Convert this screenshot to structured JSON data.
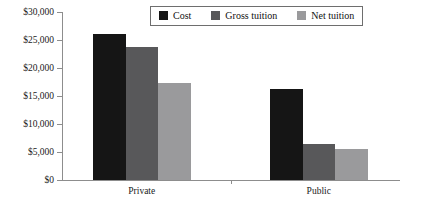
{
  "chart_data": {
    "type": "bar",
    "title": "",
    "xlabel": "",
    "ylabel": "",
    "categories": [
      "Private",
      "Public"
    ],
    "series": [
      {
        "name": "Cost",
        "color": "#151515",
        "values": [
          26000,
          16200
        ]
      },
      {
        "name": "Gross tuition",
        "color": "#58585a",
        "values": [
          23800,
          6400
        ]
      },
      {
        "name": "Net tuition",
        "color": "#9a9a9c",
        "values": [
          17300,
          5500
        ]
      }
    ],
    "ylim": [
      0,
      30000
    ],
    "yticks": [
      0,
      5000,
      10000,
      15000,
      20000,
      25000,
      30000
    ],
    "ytick_labels": [
      "$0",
      "$5,000",
      "$10,000",
      "$15,000",
      "$20,000",
      "$25,000",
      "$30,000"
    ],
    "grid": false,
    "legend_position": "top-center"
  },
  "axis": {
    "line_color": "#8d8d8d"
  }
}
